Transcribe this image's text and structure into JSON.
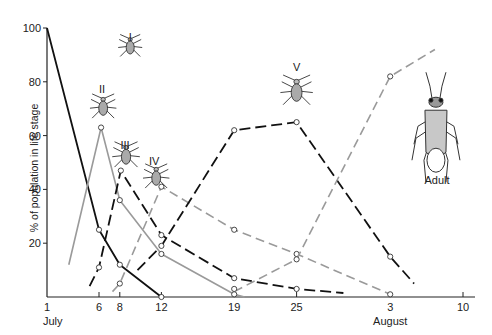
{
  "chart_data": {
    "type": "line",
    "title": "",
    "xlabel": "",
    "ylabel": "% of population in life stage",
    "ylim": [
      0,
      100
    ],
    "xlim_days": [
      1,
      41
    ],
    "grid": false,
    "legend": "inline stage labels with insect drawings",
    "y_ticks": [
      20,
      40,
      60,
      80,
      100
    ],
    "x_ticks": [
      {
        "day": 1,
        "label": "1"
      },
      {
        "day": 6,
        "label": "6"
      },
      {
        "day": 8,
        "label": "8"
      },
      {
        "day": 12,
        "label": "12"
      },
      {
        "day": 19,
        "label": "19"
      },
      {
        "day": 25,
        "label": "25"
      },
      {
        "day": 34,
        "label": "3"
      },
      {
        "day": 41,
        "label": "10"
      }
    ],
    "month_labels": [
      {
        "day": 1,
        "label": "July"
      },
      {
        "day": 34,
        "label": "August"
      }
    ],
    "x_note": "day numbers counted from 1 July (3 August = day 34, 10 August = day 41)",
    "series": [
      {
        "name": "I",
        "style": "solid",
        "color": "#111111",
        "width": 1.8,
        "points": [
          [
            1,
            100
          ],
          [
            6,
            25
          ],
          [
            8,
            12
          ],
          [
            12,
            0
          ]
        ],
        "markers": [
          [
            6,
            25
          ],
          [
            8,
            12
          ],
          [
            12,
            0
          ]
        ],
        "label_pos": [
          9,
          95
        ]
      },
      {
        "name": "II",
        "style": "solid",
        "color": "#9a9a9a",
        "width": 1.6,
        "points": [
          [
            3.1,
            12
          ],
          [
            6.2,
            63
          ],
          [
            8,
            36
          ],
          [
            12,
            16
          ],
          [
            19,
            1
          ],
          [
            20,
            0
          ]
        ],
        "markers": [
          [
            6.2,
            63
          ],
          [
            8,
            36
          ],
          [
            12,
            16
          ],
          [
            19,
            1
          ]
        ],
        "label_pos": [
          6.3,
          76
        ]
      },
      {
        "name": "III",
        "style": "dashed",
        "color": "#111111",
        "width": 1.8,
        "points": [
          [
            5.1,
            4
          ],
          [
            6,
            11
          ],
          [
            8.1,
            47
          ],
          [
            12,
            23
          ],
          [
            19,
            7
          ],
          [
            25,
            3
          ],
          [
            29.5,
            1.5
          ]
        ],
        "markers": [
          [
            6,
            11
          ],
          [
            8.1,
            47
          ],
          [
            12,
            23
          ],
          [
            19,
            7
          ],
          [
            25,
            3
          ]
        ],
        "label_pos": [
          8.5,
          55
        ]
      },
      {
        "name": "IV",
        "style": "dashed",
        "color": "#9a9a9a",
        "width": 1.6,
        "points": [
          [
            7.3,
            2
          ],
          [
            8,
            5
          ],
          [
            12,
            41
          ],
          [
            19,
            25
          ],
          [
            25,
            16
          ],
          [
            34,
            1
          ]
        ],
        "markers": [
          [
            8,
            5
          ],
          [
            12,
            41
          ],
          [
            19,
            25
          ],
          [
            25,
            16
          ],
          [
            34,
            1
          ]
        ],
        "label_pos": [
          11.3,
          49
        ]
      },
      {
        "name": "V",
        "style": "dashed",
        "color": "#111111",
        "width": 1.8,
        "points": [
          [
            9.7,
            10
          ],
          [
            12,
            19
          ],
          [
            19,
            62
          ],
          [
            25,
            65
          ],
          [
            34,
            15
          ],
          [
            36.3,
            5
          ]
        ],
        "markers": [
          [
            12,
            19
          ],
          [
            19,
            62
          ],
          [
            25,
            65
          ],
          [
            34,
            15
          ]
        ],
        "label_pos": [
          25,
          84
        ]
      },
      {
        "name": "Adult",
        "style": "dashed",
        "color": "#9a9a9a",
        "width": 1.6,
        "points": [
          [
            19,
            2
          ],
          [
            25,
            14
          ],
          [
            34,
            82
          ],
          [
            38.3,
            92
          ]
        ],
        "markers": [
          [
            19,
            3
          ],
          [
            25,
            14
          ],
          [
            34,
            82
          ]
        ],
        "label_pos": [
          38.5,
          42
        ]
      }
    ]
  },
  "axes": {
    "ylabel": "% of population in life stage"
  }
}
